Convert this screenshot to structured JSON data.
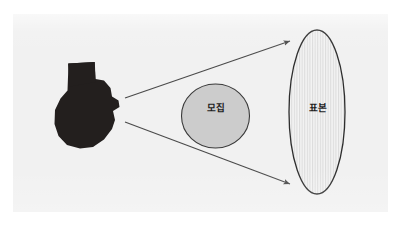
{
  "diagram": {
    "background_color": "#ffffff",
    "panel_color": "#f1f1f1",
    "shapes": {
      "silhouette": {
        "icon": "dark-blob-silhouette",
        "fill_color": "#231f1e",
        "label": ""
      },
      "circle": {
        "label": "모집",
        "fill_color": "#cccccc",
        "stroke_color": "#3a3a3a",
        "center_x": 215,
        "center_y": 116,
        "radius_x": 34,
        "radius_y": 32
      },
      "ellipse": {
        "label": "표본",
        "fill_color": "#f3f3f3",
        "stripe_color": "#d8d8d8",
        "stroke_color": "#2e2e2e",
        "center_x": 317,
        "center_y": 112,
        "radius_x": 28,
        "radius_y": 82
      }
    },
    "arrows": [
      {
        "name": "upper-arrow",
        "from_x": 125,
        "from_y": 98,
        "to_x": 292,
        "to_y": 40,
        "color": "#4a4a4a"
      },
      {
        "name": "lower-arrow",
        "from_x": 125,
        "from_y": 122,
        "to_x": 292,
        "to_y": 185,
        "color": "#4a4a4a"
      }
    ]
  }
}
